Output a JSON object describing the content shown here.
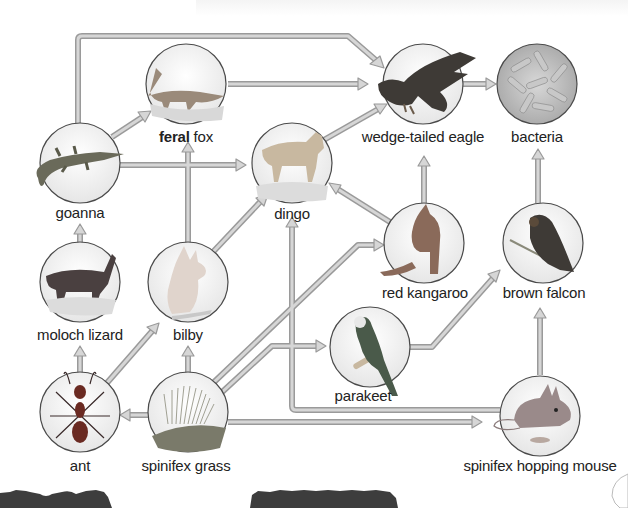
{
  "colors": {
    "arrow_fill": "#d4d4d4",
    "arrow_stroke": "#9a9a9a",
    "circle_stroke": "#4a4a4a",
    "label": "#222222",
    "bottom_bar": "#3d3d3d"
  },
  "organisms": [
    {
      "id": "feral-fox",
      "label_bold": "feral",
      "label": " fox",
      "icon": "fox-icon",
      "x": 186,
      "y": 97
    },
    {
      "id": "wedge-tailed-eagle",
      "label": "wedge-tailed eagle",
      "icon": "eagle-icon",
      "x": 423,
      "y": 84
    },
    {
      "id": "bacteria",
      "label": "bacteria",
      "icon": "bacteria-icon",
      "x": 537,
      "y": 84
    },
    {
      "id": "goanna",
      "label": "goanna",
      "icon": "goanna-icon",
      "x": 80,
      "y": 163
    },
    {
      "id": "dingo",
      "label": "dingo",
      "icon": "dingo-icon",
      "x": 292,
      "y": 163
    },
    {
      "id": "red-kangaroo",
      "label": "red kangaroo",
      "icon": "kangaroo-icon",
      "x": 424,
      "y": 243
    },
    {
      "id": "brown-falcon",
      "label": "brown falcon",
      "icon": "falcon-icon",
      "x": 543,
      "y": 243
    },
    {
      "id": "moloch-lizard",
      "label": "moloch lizard",
      "icon": "moloch-lizard-icon",
      "x": 80,
      "y": 282
    },
    {
      "id": "bilby",
      "label": "bilby",
      "icon": "bilby-icon",
      "x": 188,
      "y": 282
    },
    {
      "id": "parakeet",
      "label": "parakeet",
      "icon": "parakeet-icon",
      "x": 370,
      "y": 350
    },
    {
      "id": "ant",
      "label": "ant",
      "icon": "ant-icon",
      "x": 80,
      "y": 412
    },
    {
      "id": "spinifex-grass",
      "label": "spinifex grass",
      "icon": "grass-icon",
      "x": 188,
      "y": 412
    },
    {
      "id": "spinifex-hopping-mouse",
      "label": "spinifex hopping mouse",
      "icon": "mouse-icon",
      "x": 540,
      "y": 416
    }
  ],
  "arrows": [
    {
      "from": "goanna",
      "to": "wedge-tailed-eagle"
    },
    {
      "from": "goanna",
      "to": "feral-fox"
    },
    {
      "from": "goanna",
      "to": "dingo"
    },
    {
      "from": "feral-fox",
      "to": "wedge-tailed-eagle"
    },
    {
      "from": "dingo",
      "to": "wedge-tailed-eagle"
    },
    {
      "from": "wedge-tailed-eagle",
      "to": "bacteria"
    },
    {
      "from": "red-kangaroo",
      "to": "wedge-tailed-eagle"
    },
    {
      "from": "red-kangaroo",
      "to": "dingo"
    },
    {
      "from": "brown-falcon",
      "to": "bacteria"
    },
    {
      "from": "moloch-lizard",
      "to": "goanna"
    },
    {
      "from": "bilby",
      "to": "feral-fox"
    },
    {
      "from": "bilby",
      "to": "dingo"
    },
    {
      "from": "ant",
      "to": "moloch-lizard"
    },
    {
      "from": "ant",
      "to": "bilby"
    },
    {
      "from": "spinifex-grass",
      "to": "ant"
    },
    {
      "from": "spinifex-grass",
      "to": "bilby"
    },
    {
      "from": "spinifex-grass",
      "to": "red-kangaroo"
    },
    {
      "from": "spinifex-grass",
      "to": "parakeet"
    },
    {
      "from": "spinifex-grass",
      "to": "spinifex-hopping-mouse"
    },
    {
      "from": "parakeet",
      "to": "brown-falcon"
    },
    {
      "from": "spinifex-hopping-mouse",
      "to": "brown-falcon"
    },
    {
      "from": "spinifex-hopping-mouse",
      "to": "dingo"
    }
  ]
}
